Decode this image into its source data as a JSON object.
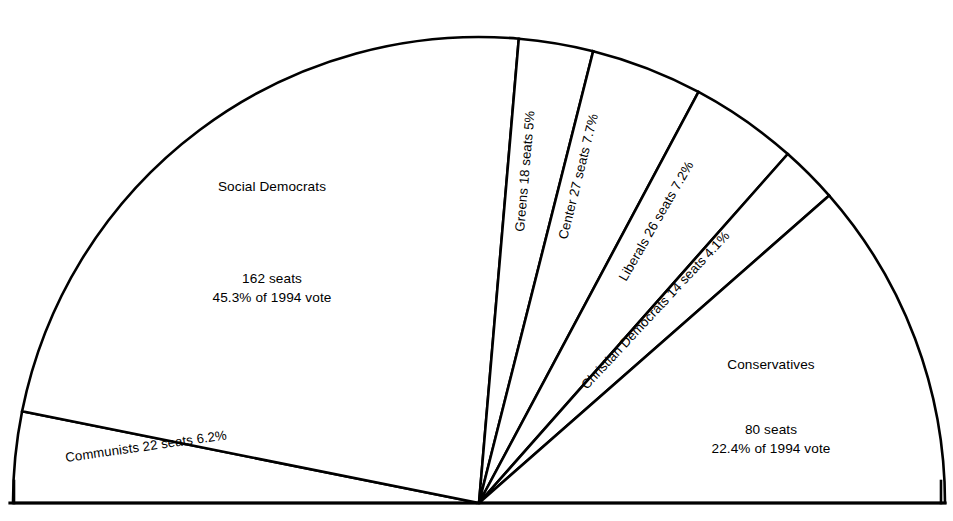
{
  "figure": {
    "type": "semicircle-seat-diagram",
    "background_color": "#ffffff",
    "stroke_color": "#000000",
    "total_seats": 349,
    "vote_year": "1994"
  },
  "chart_data": {
    "type": "pie",
    "title": "",
    "subtitle": "",
    "xlabel": "",
    "ylabel": "",
    "legend_position": "in-slice",
    "grid": false,
    "layout": "semicircle (180 degrees), seats proportional to arc angle",
    "unit": "seats",
    "total": 349,
    "categories": [
      "Communists",
      "Social Democrats",
      "Greens",
      "Center",
      "Liberals",
      "Christian Democrats",
      "Conservatives"
    ],
    "values": [
      22,
      162,
      18,
      27,
      26,
      14,
      80
    ],
    "percentages": [
      6.2,
      45.3,
      5.0,
      7.7,
      7.2,
      4.1,
      22.4
    ],
    "series": [
      {
        "name": "Seats",
        "values": [
          22,
          162,
          18,
          27,
          26,
          14,
          80
        ]
      },
      {
        "name": "Share of 1994 vote (%)",
        "values": [
          6.2,
          45.3,
          5.0,
          7.7,
          7.2,
          4.1,
          22.4
        ]
      }
    ]
  },
  "slices": [
    {
      "key": "communists",
      "name": "Communists",
      "seats": 22,
      "percent": "6.2%",
      "label_text": "Communists  22 seats  6.2%",
      "seats_text": "22 seats",
      "percent_text": "6.2%",
      "start_angle": 180,
      "end_angle": 168.65,
      "label_x": 66,
      "label_y": 462,
      "label_rotate": -8,
      "label_anchor": "start"
    },
    {
      "key": "social-democrats",
      "name": "Social Democrats",
      "seats": 162,
      "percent": "45.3%",
      "label_text": "Social Democrats",
      "seats_text": "162 seats",
      "percent_text": "45.3% of 1994 vote",
      "start_angle": 168.65,
      "end_angle": 85.1,
      "label_x": 272,
      "label_y": 191,
      "label_rotate": 0,
      "label_anchor": "middle",
      "detail_x": 272,
      "detail_y": 283,
      "detail2_y": 302
    },
    {
      "key": "greens",
      "name": "Greens",
      "seats": 18,
      "percent": "5%",
      "label_text": "Greens 18 seats  5%",
      "seats_text": "18 seats",
      "percent_text": "5%",
      "start_angle": 85.1,
      "end_angle": 75.82,
      "label_x": 524,
      "label_y": 232,
      "label_rotate": -85,
      "label_anchor": "start"
    },
    {
      "key": "center",
      "name": "Center",
      "seats": 27,
      "percent": "7.7%",
      "label_text": "Center 27 seats  7.7%",
      "seats_text": "27 seats",
      "percent_text": "7.7%",
      "start_angle": 75.82,
      "end_angle": 61.9,
      "label_x": 567,
      "label_y": 240,
      "label_rotate": -76,
      "label_anchor": "start"
    },
    {
      "key": "liberals",
      "name": "Liberals",
      "seats": 26,
      "percent": "7.2%",
      "label_text": "Liberals 26 seats  7.2%",
      "seats_text": "26 seats",
      "percent_text": "7.2%",
      "start_angle": 61.9,
      "end_angle": 48.5,
      "label_x": 626,
      "label_y": 282,
      "label_rotate": -60,
      "label_anchor": "start"
    },
    {
      "key": "christian-democrats",
      "name": "Christian Democrats",
      "seats": 14,
      "percent": "4.1%",
      "label_text": "Christian Democrats 14 seats  4.1%",
      "seats_text": "14 seats",
      "percent_text": "4.1%",
      "start_angle": 48.5,
      "end_angle": 41.28,
      "label_x": 587,
      "label_y": 390,
      "label_rotate": -47,
      "label_anchor": "start"
    },
    {
      "key": "conservatives",
      "name": "Conservatives",
      "seats": 80,
      "percent": "22.4%",
      "label_text": "Conservatives",
      "seats_text": "80 seats",
      "percent_text": "22.4% of 1994 vote",
      "start_angle": 41.28,
      "end_angle": 0,
      "label_x": 771,
      "label_y": 369,
      "label_rotate": 0,
      "label_anchor": "middle",
      "detail_x": 771,
      "detail_y": 434,
      "detail2_y": 453
    }
  ],
  "geometry": {
    "cx": 479,
    "cy": 503,
    "radius": 466,
    "baseline_left_x": 10,
    "baseline_right_x": 945,
    "baseline_y": 503,
    "stub_height": 22
  }
}
